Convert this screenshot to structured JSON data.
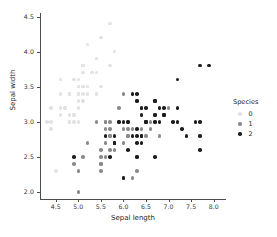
{
  "chart_data": {
    "type": "scatter",
    "title": "",
    "xlabel": "Sepal length",
    "ylabel": "Sepal width",
    "xlim": [
      4.15,
      8.25
    ],
    "ylim": [
      1.9,
      4.55
    ],
    "xticks": [
      "4.5",
      "5.0",
      "5.5",
      "6.0",
      "6.5",
      "7.0",
      "7.5",
      "8.0"
    ],
    "xtick_values": [
      4.5,
      5.0,
      5.5,
      6.0,
      6.5,
      7.0,
      7.5,
      8.0
    ],
    "yticks": [
      "2.0",
      "2.5",
      "3.0",
      "3.5",
      "4.0",
      "4.5"
    ],
    "ytick_values": [
      2.0,
      2.5,
      3.0,
      3.5,
      4.0,
      4.5
    ],
    "grid": false,
    "legend_position": "right",
    "legend_title": "Species",
    "series": [
      {
        "name": "0",
        "color": "#e2e2e2",
        "points": [
          [
            5.1,
            3.5
          ],
          [
            4.9,
            3.0
          ],
          [
            4.7,
            3.2
          ],
          [
            4.6,
            3.1
          ],
          [
            5.0,
            3.6
          ],
          [
            5.4,
            3.9
          ],
          [
            4.6,
            3.4
          ],
          [
            5.0,
            3.4
          ],
          [
            4.4,
            2.9
          ],
          [
            4.9,
            3.1
          ],
          [
            5.4,
            3.7
          ],
          [
            4.8,
            3.4
          ],
          [
            4.8,
            3.0
          ],
          [
            4.3,
            3.0
          ],
          [
            5.8,
            4.0
          ],
          [
            5.7,
            4.4
          ],
          [
            5.4,
            3.9
          ],
          [
            5.1,
            3.5
          ],
          [
            5.7,
            3.8
          ],
          [
            5.1,
            3.8
          ],
          [
            5.4,
            3.4
          ],
          [
            5.1,
            3.7
          ],
          [
            4.6,
            3.6
          ],
          [
            5.1,
            3.3
          ],
          [
            4.8,
            3.4
          ],
          [
            5.0,
            3.0
          ],
          [
            5.0,
            3.4
          ],
          [
            5.2,
            3.5
          ],
          [
            5.2,
            3.4
          ],
          [
            4.7,
            3.2
          ],
          [
            4.8,
            3.1
          ],
          [
            5.4,
            3.4
          ],
          [
            5.2,
            4.1
          ],
          [
            5.5,
            4.2
          ],
          [
            4.9,
            3.1
          ],
          [
            5.0,
            3.2
          ],
          [
            5.5,
            3.5
          ],
          [
            4.9,
            3.6
          ],
          [
            4.4,
            3.0
          ],
          [
            5.1,
            3.4
          ],
          [
            5.0,
            3.5
          ],
          [
            4.5,
            2.3
          ],
          [
            4.4,
            3.2
          ],
          [
            5.0,
            3.5
          ],
          [
            5.1,
            3.8
          ],
          [
            4.8,
            3.0
          ],
          [
            5.1,
            3.8
          ],
          [
            4.6,
            3.2
          ],
          [
            5.3,
            3.7
          ],
          [
            5.0,
            3.3
          ]
        ]
      },
      {
        "name": "1",
        "color": "#8a8a8a",
        "points": [
          [
            7.0,
            3.2
          ],
          [
            6.4,
            3.2
          ],
          [
            6.9,
            3.1
          ],
          [
            5.5,
            2.3
          ],
          [
            6.5,
            2.8
          ],
          [
            5.7,
            2.8
          ],
          [
            6.3,
            3.3
          ],
          [
            4.9,
            2.4
          ],
          [
            6.6,
            2.9
          ],
          [
            5.2,
            2.7
          ],
          [
            5.0,
            2.0
          ],
          [
            5.9,
            3.0
          ],
          [
            6.0,
            2.2
          ],
          [
            6.1,
            2.9
          ],
          [
            5.6,
            2.9
          ],
          [
            6.7,
            3.1
          ],
          [
            5.6,
            3.0
          ],
          [
            5.8,
            2.7
          ],
          [
            6.2,
            2.2
          ],
          [
            5.6,
            2.5
          ],
          [
            5.9,
            3.2
          ],
          [
            6.1,
            2.8
          ],
          [
            6.3,
            2.5
          ],
          [
            6.1,
            2.8
          ],
          [
            6.4,
            2.9
          ],
          [
            6.6,
            3.0
          ],
          [
            6.8,
            2.8
          ],
          [
            6.7,
            3.0
          ],
          [
            6.0,
            2.9
          ],
          [
            5.7,
            2.6
          ],
          [
            5.5,
            2.4
          ],
          [
            5.5,
            2.4
          ],
          [
            5.8,
            2.7
          ],
          [
            6.0,
            2.7
          ],
          [
            5.4,
            3.0
          ],
          [
            6.0,
            3.4
          ],
          [
            6.7,
            3.1
          ],
          [
            6.3,
            2.3
          ],
          [
            5.6,
            3.0
          ],
          [
            5.5,
            2.5
          ],
          [
            5.5,
            2.6
          ],
          [
            6.1,
            3.0
          ],
          [
            5.8,
            2.6
          ],
          [
            5.0,
            2.3
          ],
          [
            5.6,
            2.7
          ],
          [
            5.7,
            3.0
          ],
          [
            5.7,
            2.9
          ],
          [
            6.2,
            2.9
          ],
          [
            5.1,
            2.5
          ],
          [
            5.7,
            2.8
          ]
        ]
      },
      {
        "name": "2",
        "color": "#1c1c1c",
        "points": [
          [
            6.3,
            3.3
          ],
          [
            5.8,
            2.7
          ],
          [
            7.1,
            3.0
          ],
          [
            6.3,
            2.9
          ],
          [
            6.5,
            3.0
          ],
          [
            7.6,
            3.0
          ],
          [
            4.9,
            2.5
          ],
          [
            7.3,
            2.9
          ],
          [
            6.7,
            2.5
          ],
          [
            7.2,
            3.6
          ],
          [
            6.5,
            3.2
          ],
          [
            6.4,
            2.7
          ],
          [
            6.8,
            3.0
          ],
          [
            5.7,
            2.5
          ],
          [
            5.8,
            2.8
          ],
          [
            6.4,
            3.2
          ],
          [
            6.5,
            3.0
          ],
          [
            7.7,
            3.8
          ],
          [
            7.7,
            2.6
          ],
          [
            6.0,
            2.2
          ],
          [
            6.9,
            3.2
          ],
          [
            5.6,
            2.8
          ],
          [
            7.7,
            2.8
          ],
          [
            6.3,
            2.7
          ],
          [
            6.7,
            3.3
          ],
          [
            7.2,
            3.2
          ],
          [
            6.2,
            2.8
          ],
          [
            6.1,
            3.0
          ],
          [
            6.4,
            2.8
          ],
          [
            7.2,
            3.0
          ],
          [
            7.4,
            2.8
          ],
          [
            7.9,
            3.8
          ],
          [
            6.4,
            2.8
          ],
          [
            6.3,
            2.8
          ],
          [
            6.1,
            2.6
          ],
          [
            7.7,
            3.0
          ],
          [
            6.3,
            3.4
          ],
          [
            6.4,
            3.1
          ],
          [
            6.0,
            3.0
          ],
          [
            6.9,
            3.1
          ],
          [
            6.7,
            3.1
          ],
          [
            6.9,
            3.1
          ],
          [
            5.8,
            2.7
          ],
          [
            6.8,
            3.2
          ],
          [
            6.7,
            3.3
          ],
          [
            6.7,
            3.0
          ],
          [
            6.3,
            2.5
          ],
          [
            6.5,
            3.0
          ],
          [
            6.2,
            3.4
          ],
          [
            5.9,
            3.0
          ]
        ]
      }
    ]
  }
}
